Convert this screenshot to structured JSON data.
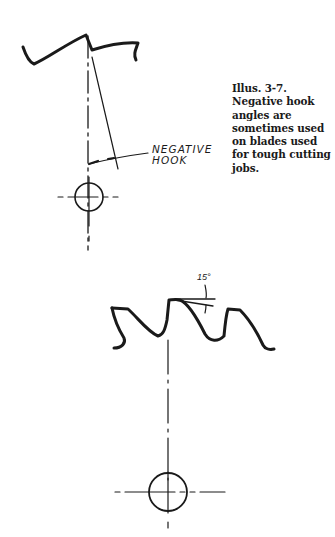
{
  "figure": {
    "caption_lines": [
      "Illus. 3-7.",
      "Negative hook",
      "angles are",
      "sometimes used",
      "on blades used",
      "for tough cutting",
      "jobs."
    ],
    "top_diagram": {
      "label_lines": [
        "NEGATIVE",
        "HOOK"
      ]
    },
    "bottom_diagram": {
      "angle_label": "15°"
    }
  }
}
